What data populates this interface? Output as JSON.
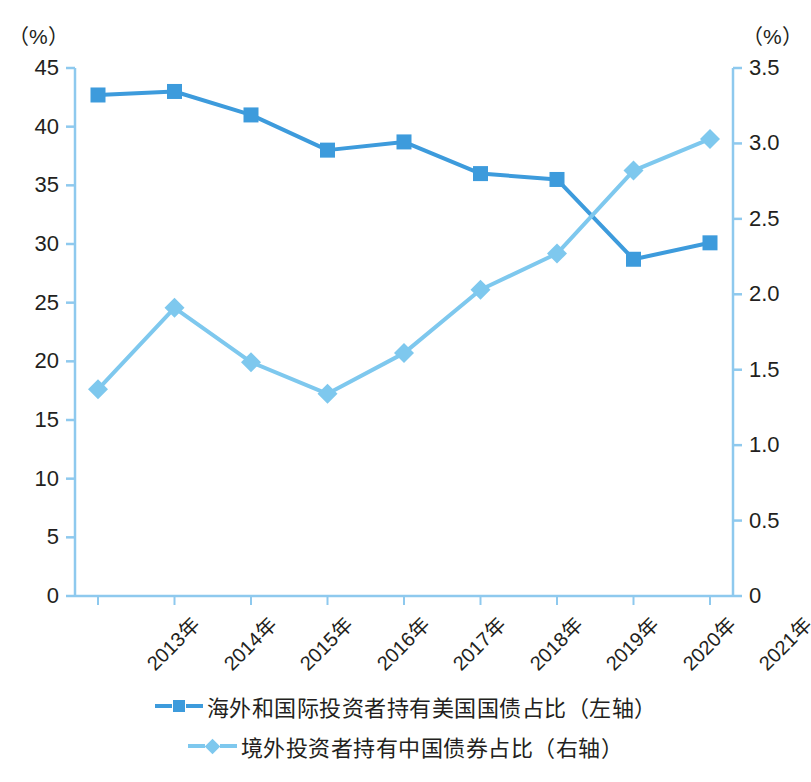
{
  "chart_data": {
    "type": "line",
    "title": "",
    "subtitle": "",
    "xlabel": "",
    "ylabel": "（%）",
    "y2label": "（%）",
    "grid": false,
    "legend_position": "bottom",
    "categories": [
      "2013年",
      "2014年",
      "2015年",
      "2016年",
      "2017年",
      "2018年",
      "2019年",
      "2020年",
      "2021年"
    ],
    "left_axis": {
      "label": "（%）",
      "ticks": [
        "45",
        "40",
        "35",
        "30",
        "25",
        "20",
        "15",
        "10",
        "5",
        "0"
      ],
      "tick_values": [
        45,
        40,
        35,
        30,
        25,
        20,
        15,
        10,
        5,
        0
      ],
      "ylim": [
        0,
        45
      ]
    },
    "right_axis": {
      "label": "（%）",
      "ticks": [
        "3.5",
        "3.0",
        "2.5",
        "2.0",
        "1.5",
        "1.0",
        "0.5",
        "0"
      ],
      "tick_values": [
        3.5,
        3.0,
        2.5,
        2.0,
        1.5,
        1.0,
        0.5,
        0
      ],
      "ylim": [
        0,
        3.5
      ]
    },
    "series": [
      {
        "name": "海外和国际投资者持有美国国债占比（左轴）",
        "axis": "left",
        "marker": "square",
        "color": "#3d9bdc",
        "values": [
          42.7,
          43.0,
          41.0,
          38.0,
          38.7,
          36.0,
          35.5,
          28.7,
          30.1
        ]
      },
      {
        "name": "境外投资者持有中国债券占比（右轴）",
        "axis": "right",
        "marker": "diamond",
        "color": "#7ec8ee",
        "values": [
          1.37,
          1.91,
          1.55,
          1.34,
          1.61,
          2.03,
          2.27,
          2.82,
          3.03
        ]
      }
    ]
  },
  "legend": {
    "items": [
      {
        "label": "海外和国际投资者持有美国国债占比（左轴）",
        "marker": "square",
        "color": "#3d9bdc"
      },
      {
        "label": "境外投资者持有中国债券占比（右轴）",
        "marker": "diamond",
        "color": "#7ec8ee"
      }
    ]
  },
  "colors": {
    "series_1": "#3d9bdc",
    "series_2": "#7ec8ee",
    "axis": "#8ec9ee",
    "text": "#231f20",
    "background": "#ffffff"
  }
}
